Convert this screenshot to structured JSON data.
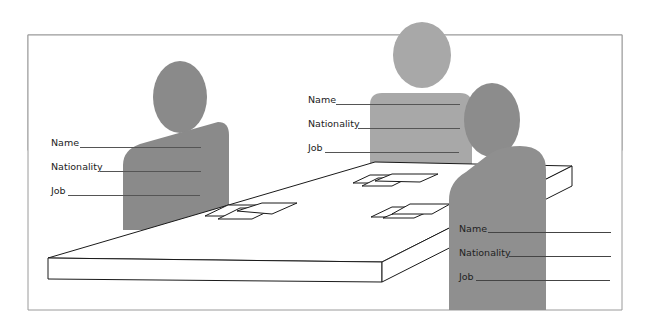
{
  "colors": {
    "person_left": "#8a8a8a",
    "person_back": "#a8a8a8",
    "person_right_head": "#8c8c8c",
    "person_right_body": "#8f8f8f",
    "frame": "#999999",
    "table_stroke": "#1a1a1a"
  },
  "forms": [
    {
      "id": "left",
      "fields": [
        {
          "label": "Name"
        },
        {
          "label": "Nationality"
        },
        {
          "label": "Job"
        }
      ]
    },
    {
      "id": "back",
      "fields": [
        {
          "label": "Name"
        },
        {
          "label": "Nationality"
        },
        {
          "label": "Job"
        }
      ]
    },
    {
      "id": "right",
      "fields": [
        {
          "label": "Name"
        },
        {
          "label": "Nationality"
        },
        {
          "label": "Job"
        }
      ]
    }
  ]
}
